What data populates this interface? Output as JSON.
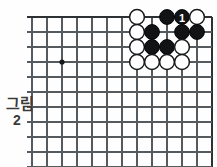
{
  "figure": {
    "caption_lines": [
      "그림",
      "2"
    ],
    "caption_full": "그림 2"
  },
  "board": {
    "type": "go-board-corner",
    "corner": "upper-right",
    "columns": 12,
    "rows": 10,
    "cell_size": 15,
    "origin_x": 32,
    "origin_y": 17,
    "edges": [
      "top",
      "right"
    ],
    "colors": {
      "background": "#fefefe",
      "grid_line": "#555a5e",
      "edge_line": "#2e3134",
      "black_stone": "#111315",
      "white_stone": "#ffffff",
      "stone_outline": "#17191b",
      "label_text": "#ffffff",
      "caption_text": "#3a3a3a"
    },
    "star_points": [
      {
        "col": 2,
        "row": 3,
        "name": "hoshi"
      }
    ],
    "stones": [
      {
        "id": "w1",
        "color": "white",
        "col": 7,
        "row": 0,
        "label": ""
      },
      {
        "id": "b1",
        "color": "black",
        "col": 9,
        "row": 0,
        "label": ""
      },
      {
        "id": "b2",
        "color": "black",
        "col": 10,
        "row": 0,
        "label": "1"
      },
      {
        "id": "w2",
        "color": "white",
        "col": 11,
        "row": 0,
        "label": ""
      },
      {
        "id": "w3",
        "color": "white",
        "col": 7,
        "row": 1,
        "label": ""
      },
      {
        "id": "b3",
        "color": "black",
        "col": 8,
        "row": 1,
        "label": ""
      },
      {
        "id": "b4",
        "color": "black",
        "col": 10,
        "row": 1,
        "label": ""
      },
      {
        "id": "b5",
        "color": "black",
        "col": 11,
        "row": 1,
        "label": ""
      },
      {
        "id": "w4",
        "color": "white",
        "col": 7,
        "row": 2,
        "label": ""
      },
      {
        "id": "b6",
        "color": "black",
        "col": 8,
        "row": 2,
        "label": ""
      },
      {
        "id": "b7",
        "color": "black",
        "col": 9,
        "row": 2,
        "label": ""
      },
      {
        "id": "w5",
        "color": "white",
        "col": 10,
        "row": 2,
        "label": ""
      },
      {
        "id": "w6",
        "color": "white",
        "col": 7,
        "row": 3,
        "label": ""
      },
      {
        "id": "w7",
        "color": "white",
        "col": 8,
        "row": 3,
        "label": ""
      },
      {
        "id": "w8",
        "color": "white",
        "col": 9,
        "row": 3,
        "label": ""
      },
      {
        "id": "w9",
        "color": "white",
        "col": 10,
        "row": 3,
        "label": ""
      }
    ]
  }
}
